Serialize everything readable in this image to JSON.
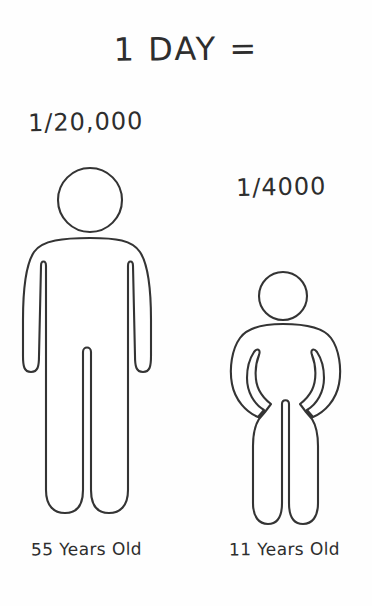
{
  "page": {
    "title": "1 DAY =",
    "background_color": "#fefefe",
    "ink_color": "#343434"
  },
  "figures": [
    {
      "id": "adult",
      "ratio_label": "1/20,000",
      "caption": "55 Years Old",
      "age_years": 55,
      "fraction_denominator": 20000,
      "pictogram": "standing-person-arms-down",
      "relative_height": "tall"
    },
    {
      "id": "child",
      "ratio_label": "1/4000",
      "caption": "11 Years Old",
      "age_years": 11,
      "fraction_denominator": 4000,
      "pictogram": "standing-person-hands-on-hips",
      "relative_height": "short"
    }
  ],
  "labels": {
    "title": "1 DAY =",
    "ratio_left": "1/20,000",
    "ratio_right": "1/4000",
    "caption_left": "55 Years Old",
    "caption_right": "11 Years Old"
  }
}
